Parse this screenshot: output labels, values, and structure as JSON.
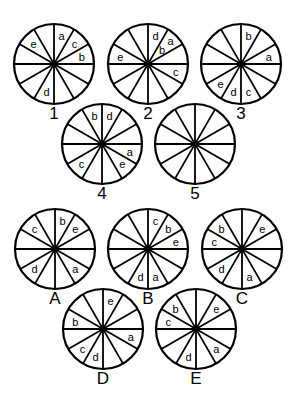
{
  "puzzle": {
    "style": {
      "stroke": "#000000",
      "background": "#ffffff",
      "segments": 12,
      "radius": 40
    },
    "question_figures": [
      {
        "id": "1",
        "cx": 54,
        "cy": 64,
        "labels": [
          {
            "t": "a",
            "slot": 0
          },
          {
            "t": "c",
            "slot": 1
          },
          {
            "t": "b",
            "slot": 2
          },
          {
            "t": "d",
            "slot": 6
          },
          {
            "t": "e",
            "slot": 10
          }
        ]
      },
      {
        "id": "2",
        "cx": 148,
        "cy": 64,
        "labels": [
          {
            "t": "d",
            "slot": 0
          },
          {
            "t": "b",
            "slot": 1,
            "r": 0.5
          },
          {
            "t": "a",
            "slot": 1,
            "r": 0.8
          },
          {
            "t": "c",
            "slot": 3
          },
          {
            "t": "e",
            "slot": 9
          }
        ]
      },
      {
        "id": "3",
        "cx": 241,
        "cy": 64,
        "labels": [
          {
            "t": "b",
            "slot": 0
          },
          {
            "t": "a",
            "slot": 2
          },
          {
            "t": "c",
            "slot": 5
          },
          {
            "t": "d",
            "slot": 6
          },
          {
            "t": "e",
            "slot": 7
          }
        ]
      },
      {
        "id": "4",
        "cx": 102,
        "cy": 144,
        "labels": [
          {
            "t": "d",
            "slot": 0
          },
          {
            "t": "a",
            "slot": 3
          },
          {
            "t": "e",
            "slot": 4
          },
          {
            "t": "c",
            "slot": 7
          },
          {
            "t": "b",
            "slot": 11
          }
        ]
      },
      {
        "id": "5",
        "cx": 195,
        "cy": 144,
        "labels": []
      }
    ],
    "answer_options": [
      {
        "id": "A",
        "cx": 55,
        "cy": 249,
        "labels": [
          {
            "t": "b",
            "slot": 0
          },
          {
            "t": "e",
            "slot": 1
          },
          {
            "t": "a",
            "slot": 4
          },
          {
            "t": "d",
            "slot": 7
          },
          {
            "t": "c",
            "slot": 10
          }
        ]
      },
      {
        "id": "B",
        "cx": 148,
        "cy": 249,
        "labels": [
          {
            "t": "c",
            "slot": 0
          },
          {
            "t": "b",
            "slot": 1
          },
          {
            "t": "e",
            "slot": 2
          },
          {
            "t": "a",
            "slot": 5
          },
          {
            "t": "d",
            "slot": 6
          }
        ]
      },
      {
        "id": "C",
        "cx": 242,
        "cy": 249,
        "labels": [
          {
            "t": "e",
            "slot": 1
          },
          {
            "t": "a",
            "slot": 5
          },
          {
            "t": "d",
            "slot": 7
          },
          {
            "t": "c",
            "slot": 9
          },
          {
            "t": "b",
            "slot": 10
          }
        ]
      },
      {
        "id": "D",
        "cx": 103,
        "cy": 329,
        "labels": [
          {
            "t": "e",
            "slot": 0
          },
          {
            "t": "a",
            "slot": 3
          },
          {
            "t": "d",
            "slot": 6
          },
          {
            "t": "c",
            "slot": 7
          },
          {
            "t": "b",
            "slot": 9
          }
        ]
      },
      {
        "id": "E",
        "cx": 196,
        "cy": 329,
        "labels": [
          {
            "t": "e",
            "slot": 1
          },
          {
            "t": "a",
            "slot": 4
          },
          {
            "t": "d",
            "slot": 6
          },
          {
            "t": "c",
            "slot": 9
          },
          {
            "t": "b",
            "slot": 10
          }
        ]
      }
    ]
  }
}
